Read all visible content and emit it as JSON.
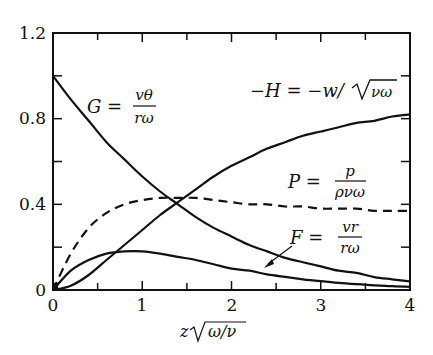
{
  "chart_data": {
    "type": "line",
    "title": "",
    "xlabel": "z√(ω/ν)",
    "ylabel": "",
    "xlim": [
      0,
      4
    ],
    "ylim": [
      0,
      1.2
    ],
    "grid": false,
    "legend_position": "inline labels",
    "x_ticks": [
      "0",
      "1",
      "2",
      "3",
      "4"
    ],
    "y_ticks": [
      "0",
      "0.4",
      "0.8",
      "1.2"
    ],
    "x": [
      0,
      0.2,
      0.4,
      0.6,
      0.8,
      1.0,
      1.2,
      1.4,
      1.6,
      1.8,
      2.0,
      2.2,
      2.4,
      2.6,
      2.8,
      3.0,
      3.2,
      3.4,
      3.6,
      3.8,
      4.0
    ],
    "series": [
      {
        "name": "G = vθ/(rω)",
        "style": "solid",
        "values": [
          1.0,
          0.89,
          0.79,
          0.69,
          0.61,
          0.53,
          0.46,
          0.4,
          0.34,
          0.29,
          0.25,
          0.21,
          0.18,
          0.15,
          0.13,
          0.11,
          0.09,
          0.08,
          0.06,
          0.05,
          0.04
        ]
      },
      {
        "name": "-H = -w/√(νω)",
        "style": "solid",
        "values": [
          0,
          0.02,
          0.07,
          0.14,
          0.21,
          0.28,
          0.35,
          0.41,
          0.47,
          0.53,
          0.58,
          0.62,
          0.66,
          0.69,
          0.72,
          0.74,
          0.76,
          0.78,
          0.79,
          0.81,
          0.82
        ]
      },
      {
        "name": "P = p/(ρνω)",
        "style": "dashed",
        "values": [
          0,
          0.17,
          0.29,
          0.36,
          0.4,
          0.42,
          0.43,
          0.43,
          0.43,
          0.42,
          0.41,
          0.4,
          0.4,
          0.39,
          0.39,
          0.38,
          0.38,
          0.38,
          0.37,
          0.37,
          0.37
        ]
      },
      {
        "name": "F = vr/(rω)",
        "style": "solid",
        "values": [
          0,
          0.09,
          0.14,
          0.17,
          0.18,
          0.18,
          0.17,
          0.155,
          0.14,
          0.12,
          0.1,
          0.09,
          0.073,
          0.061,
          0.05,
          0.041,
          0.033,
          0.027,
          0.022,
          0.018,
          0.015
        ]
      }
    ],
    "annotations": [
      {
        "text": "G = vθ / rω",
        "x": 0.55,
        "y": 0.83
      },
      {
        "text": "−H = −w/√(νω)",
        "x": 2.2,
        "y": 0.87
      },
      {
        "text": "P = p / ρνω",
        "x": 2.2,
        "y": 0.52
      },
      {
        "text": "F = vr / rω",
        "x": 2.3,
        "y": 0.24,
        "arrow_to": [
          1.85,
          0.12
        ]
      }
    ]
  },
  "labels": {
    "x_axis": "z",
    "x_axis_root": "ω/ν",
    "tick_x": [
      "0",
      "1",
      "2",
      "3",
      "4"
    ],
    "tick_y": [
      "0",
      "0.4",
      "0.8",
      "1.2"
    ],
    "G": {
      "lhs": "G =",
      "num": "vθ",
      "den": "rω"
    },
    "H": {
      "text": "−H = −w/",
      "root": "νω"
    },
    "P": {
      "lhs": "P =",
      "num": "p",
      "den": "ρνω"
    },
    "F": {
      "lhs": "F =",
      "num": "vr",
      "den": "rω"
    }
  }
}
